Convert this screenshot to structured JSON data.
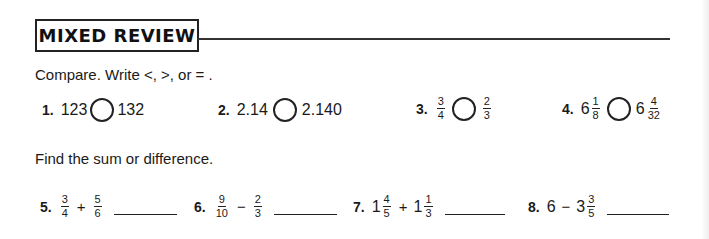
{
  "heading": {
    "title": "MIXED REVIEW"
  },
  "section_compare": {
    "instruction": "Compare. Write <, >, or  = .",
    "items": [
      {
        "number": "1.",
        "left": "123",
        "right": "132"
      },
      {
        "number": "2.",
        "left": "2.14",
        "right": "2.140"
      },
      {
        "number": "3.",
        "left": {
          "num": "3",
          "den": "4"
        },
        "right": {
          "num": "2",
          "den": "3"
        }
      },
      {
        "number": "4.",
        "left": {
          "whole": "6",
          "num": "1",
          "den": "8"
        },
        "right": {
          "whole": "6",
          "num": "4",
          "den": "32"
        }
      }
    ]
  },
  "section_sum": {
    "instruction": "Find the sum or difference.",
    "items": [
      {
        "number": "5.",
        "a": {
          "num": "3",
          "den": "4"
        },
        "op": "+",
        "b": {
          "num": "5",
          "den": "6"
        }
      },
      {
        "number": "6.",
        "a": {
          "num": "9",
          "den": "10"
        },
        "op": "−",
        "b": {
          "num": "2",
          "den": "3"
        }
      },
      {
        "number": "7.",
        "a": {
          "whole": "1",
          "num": "4",
          "den": "5"
        },
        "op": "+",
        "b": {
          "whole": "1",
          "num": "1",
          "den": "3"
        }
      },
      {
        "number": "8.",
        "a": {
          "whole": "6"
        },
        "op": "−",
        "b": {
          "whole": "3",
          "num": "3",
          "den": "5"
        }
      }
    ]
  }
}
